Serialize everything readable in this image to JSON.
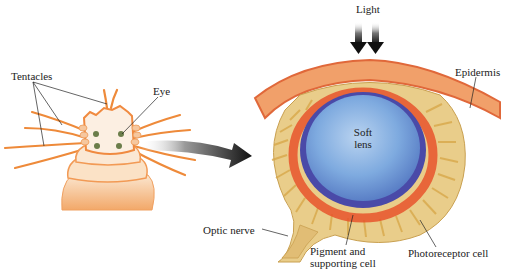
{
  "labels": {
    "light": "Light",
    "tentacles": "Tentacles",
    "eye": "Eye",
    "epidermis": "Epidermis",
    "soft_lens_line1": "Soft",
    "soft_lens_line2": "lens",
    "optic_nerve": "Optic nerve",
    "pigment_line1": "Pigment and",
    "pigment_line2": "supporting cell",
    "photoreceptor": "Photoreceptor cell"
  },
  "colors": {
    "worm_body": "#f3b07a",
    "worm_light": "#fbe6cf",
    "tentacle": "#ee8a3a",
    "eye_spot": "#6b7d4a",
    "epidermis": "#e8763a",
    "cup_yellow": "#e6c57a",
    "pigment_red": "#e8542c",
    "lens_blue": "#6f9fd6",
    "lens_edge": "#4a4aa8",
    "arrow": "#1a1a1a"
  }
}
